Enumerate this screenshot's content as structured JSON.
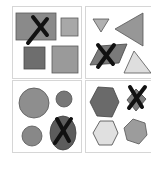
{
  "panels": [
    {
      "label": "squares",
      "crossed": "large wide rectangle",
      "colors": {
        "a": "#8a8a8a",
        "b": "#a8a8a8",
        "c": "#6e6e6e",
        "d": "#9a9a9a"
      }
    },
    {
      "label": "triangles",
      "crossed": "parallelogram",
      "colors": {
        "a": "#b0b0b0",
        "b": "#979797",
        "c": "#7a7a7a",
        "d": "#dedede"
      }
    },
    {
      "label": "circles",
      "crossed": "ellipse",
      "colors": {
        "a": "#8e8e8e",
        "b": "#777777",
        "c": "#888888",
        "d": "#5c5c5c"
      }
    },
    {
      "label": "hexagons",
      "crossed": "diamond",
      "colors": {
        "a": "#6a6a6a",
        "b": "#7d7d7d",
        "c": "#e0e0e0",
        "d": "#9c9c9c"
      }
    }
  ],
  "colors": {
    "cross": "#111111",
    "stroke": "#4a4a4a",
    "border": "#d6d6d6"
  }
}
